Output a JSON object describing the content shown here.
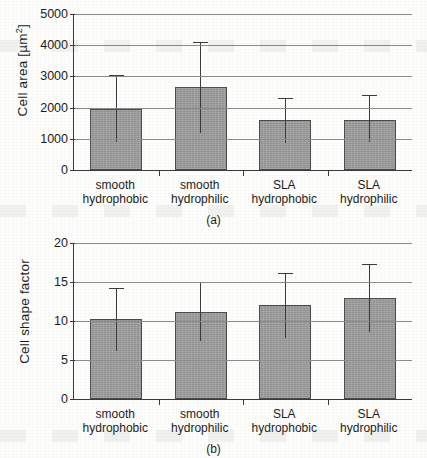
{
  "chart_data": [
    {
      "type": "bar",
      "panel": "(a)",
      "title": "",
      "xlabel": "",
      "ylabel": "Cell area [µm²]",
      "ylabel_base": "Cell area [µm",
      "ylabel_sup": "2",
      "ylabel_tail": "]",
      "ylim": [
        0,
        5000
      ],
      "ytick_step": 1000,
      "yticks": [
        0,
        1000,
        2000,
        3000,
        4000,
        5000
      ],
      "ytick_labels": [
        "0",
        "1000",
        "2000",
        "3000",
        "4000",
        "5000"
      ],
      "grid": true,
      "legend": "none",
      "categories": [
        "smooth hydrophobic",
        "smooth hydrophilic",
        "SLA hydrophobic",
        "SLA hydrophilic"
      ],
      "category_lines": [
        [
          "smooth",
          "hydrophobic"
        ],
        [
          "smooth",
          "hydrophilic"
        ],
        [
          "SLA",
          "hydrophobic"
        ],
        [
          "SLA",
          "hydrophilic"
        ]
      ],
      "values": [
        1950,
        2650,
        1600,
        1600
      ],
      "err_low": [
        900,
        1180,
        850,
        900
      ],
      "err_high": [
        3050,
        4100,
        2300,
        2400
      ]
    },
    {
      "type": "bar",
      "panel": "(b)",
      "title": "",
      "xlabel": "",
      "ylabel": "Cell shape factor",
      "ylim": [
        0,
        20
      ],
      "ytick_step": 5,
      "yticks": [
        0,
        5,
        10,
        15,
        20
      ],
      "ytick_labels": [
        "0",
        "5",
        "10",
        "15",
        "20"
      ],
      "grid": true,
      "legend": "none",
      "categories": [
        "smooth hydrophobic",
        "smooth hydrophilic",
        "SLA hydrophobic",
        "SLA hydrophilic"
      ],
      "category_lines": [
        [
          "smooth",
          "hydrophobic"
        ],
        [
          "smooth",
          "hydrophilic"
        ],
        [
          "SLA",
          "hydrophobic"
        ],
        [
          "SLA",
          "hydrophilic"
        ]
      ],
      "values": [
        10.2,
        11.2,
        12.0,
        13.0
      ],
      "err_low": [
        6.1,
        7.4,
        7.8,
        8.6
      ],
      "err_high": [
        14.2,
        15.0,
        16.2,
        17.3
      ]
    }
  ],
  "style": {
    "bar_fill": "#9b9b9b",
    "bar_stroke": "#4c4c4c",
    "grid_color": "#8c8c8c",
    "axis_color": "#3a3a3a",
    "error_color": "#3c3c3c",
    "page_background": "#fdfdfb"
  }
}
